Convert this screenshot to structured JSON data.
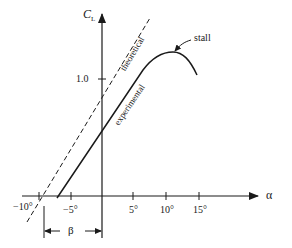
{
  "diagram": {
    "type": "lift-curve",
    "y_axis": {
      "label": "C",
      "subscript": "L",
      "ticks": [
        {
          "value": 1.0,
          "label": "1.0"
        }
      ]
    },
    "x_axis": {
      "label": "α",
      "ticks": [
        {
          "value": -10,
          "label": "−10°"
        },
        {
          "value": -5,
          "label": "−5°"
        },
        {
          "value": 5,
          "label": "5°"
        },
        {
          "value": 10,
          "label": "10°"
        },
        {
          "value": 15,
          "label": "15°"
        }
      ]
    },
    "curves": [
      {
        "name": "theoretical",
        "label": "theoretical",
        "style": "dashed"
      },
      {
        "name": "experimental",
        "label": "experimental",
        "style": "solid"
      }
    ],
    "annotations": {
      "stall": "stall",
      "beta": "β"
    }
  }
}
